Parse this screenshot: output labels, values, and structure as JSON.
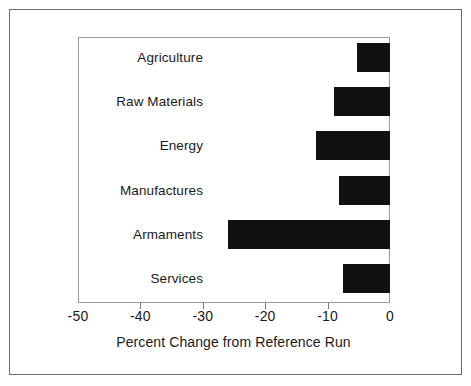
{
  "chart_data": {
    "type": "bar",
    "orientation": "horizontal",
    "title": "",
    "subtitle": "",
    "xlabel": "Percent Change from Reference Run",
    "ylabel": "",
    "categories": [
      "Agriculture",
      "Raw Materials",
      "Energy",
      "Manufactures",
      "Armaments",
      "Services"
    ],
    "values": [
      -5.3,
      -9.0,
      -11.9,
      -8.2,
      -26.0,
      -7.5
    ],
    "xlim": [
      -50,
      0
    ],
    "xticks": [
      -50,
      -40,
      -30,
      -20,
      -10,
      0
    ],
    "xtick_labels": [
      "-50",
      "-40",
      "-30",
      "-20",
      "-10",
      "0"
    ],
    "grid": false,
    "legend": null,
    "bar_color": "#111111",
    "background_color": "#ffffff",
    "axis_color": "#9a9a9a",
    "text_color": "#1a1a1a",
    "annotations": []
  },
  "figure": {
    "frame_color": "#6e6e6e",
    "x_axis_title": "Percent Change from Reference Run"
  }
}
